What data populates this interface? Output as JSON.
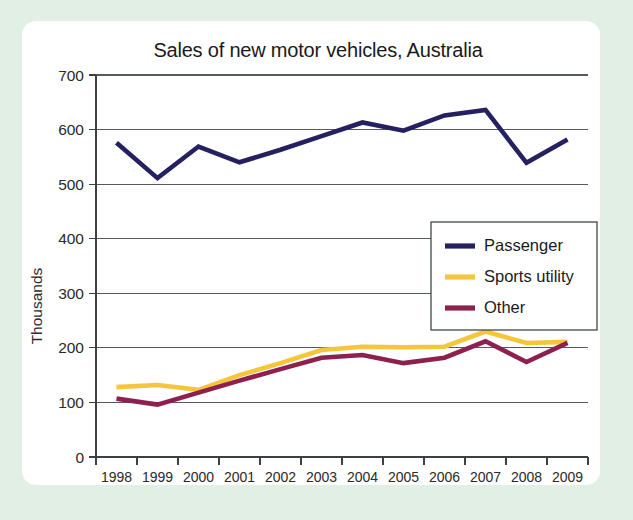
{
  "card": {
    "background_color": "#ffffff",
    "page_background_color": "#e2efe5"
  },
  "chart_data": {
    "type": "line",
    "title": "Sales of new motor vehicles, Australia",
    "xlabel": "",
    "ylabel": "Thousands",
    "categories": [
      "1998",
      "1999",
      "2000",
      "2001",
      "2002",
      "2003",
      "2004",
      "2005",
      "2006",
      "2007",
      "2008",
      "2009"
    ],
    "ylim": [
      0,
      700
    ],
    "yticks": [
      0,
      100,
      200,
      300,
      400,
      500,
      600,
      700
    ],
    "grid": true,
    "legend_position": "center-right",
    "series": [
      {
        "name": "Passenger",
        "color": "#252060",
        "values": [
          576,
          511,
          569,
          540,
          563,
          588,
          613,
          598,
          626,
          636,
          539,
          582
        ]
      },
      {
        "name": "Sports utility",
        "color": "#f5c63c",
        "values": [
          128,
          132,
          123,
          150,
          172,
          196,
          202,
          201,
          202,
          230,
          209,
          211
        ]
      },
      {
        "name": "Other",
        "color": "#8e2050",
        "values": [
          107,
          96,
          118,
          140,
          161,
          182,
          187,
          172,
          182,
          212,
          174,
          209
        ]
      }
    ]
  }
}
